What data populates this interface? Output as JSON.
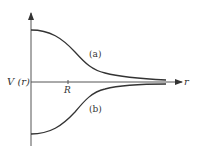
{
  "figure": {
    "y_axis_label": "V (r)",
    "x_axis_label": "r",
    "tick_label": "R",
    "curves": [
      {
        "id": "a",
        "label": "(a)",
        "description": "repulsive potential, positive, decays to zero"
      },
      {
        "id": "b",
        "label": "(b)",
        "description": "attractive potential, negative, rises to zero"
      }
    ],
    "colors": {
      "line": "#333333",
      "axis": "#555555"
    }
  }
}
